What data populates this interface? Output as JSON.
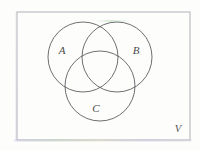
{
  "figure": {
    "kind": "venn-diagram",
    "set_count": 3,
    "background_color": "#fdfdfc",
    "stroke_color": "#555558",
    "border_color": "#b8b8bc",
    "label_color": "#4a4a4a"
  },
  "universe": {
    "label": "V",
    "rect": {
      "x": 17,
      "y": 12,
      "width": 173,
      "height": 128
    }
  },
  "sets": [
    {
      "id": "A",
      "label": "A",
      "circle": {
        "cx": 83,
        "cy": 57,
        "r": 35
      },
      "label_pos": {
        "x": 62,
        "y": 54
      }
    },
    {
      "id": "B",
      "label": "B",
      "circle": {
        "cx": 117,
        "cy": 57,
        "r": 35
      },
      "label_pos": {
        "x": 136,
        "y": 54
      }
    },
    {
      "id": "C",
      "label": "C",
      "circle": {
        "cx": 100,
        "cy": 86,
        "r": 35
      },
      "label_pos": {
        "x": 96,
        "y": 112
      }
    }
  ]
}
